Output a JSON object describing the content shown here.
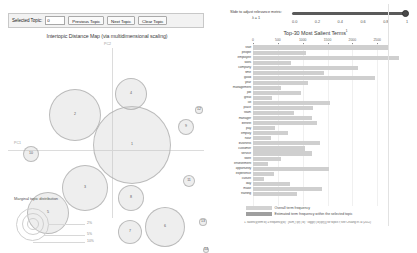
{
  "toolbar": {
    "selected_topic_label": "Selected Topic:",
    "topic_value": "0",
    "previous_button": "Previous Topic",
    "next_button": "Next Topic",
    "clear_button": "Clear Topic"
  },
  "left_panel": {
    "title": "Intertopic Distance Map (via multidimensional scaling)",
    "axis_x_label": "PC1",
    "axis_y_label": "PC2",
    "legend": {
      "title": "Marginal topic distribution",
      "sizes": [
        "2%",
        "5%",
        "10%"
      ]
    },
    "topics": [
      {
        "id": "1",
        "x": 132,
        "y": 105,
        "r": 39
      },
      {
        "id": "2",
        "x": 75,
        "y": 75,
        "r": 26
      },
      {
        "id": "3",
        "x": 85,
        "y": 148,
        "r": 23
      },
      {
        "id": "4",
        "x": 131,
        "y": 54,
        "r": 16
      },
      {
        "id": "5",
        "x": 48,
        "y": 173,
        "r": 21
      },
      {
        "id": "6",
        "x": 165,
        "y": 187,
        "r": 20
      },
      {
        "id": "7",
        "x": 130,
        "y": 192,
        "r": 12
      },
      {
        "id": "8",
        "x": 131,
        "y": 158,
        "r": 13
      },
      {
        "id": "9",
        "x": 186,
        "y": 87,
        "r": 8
      },
      {
        "id": "10",
        "x": 31,
        "y": 114,
        "r": 8
      },
      {
        "id": "11",
        "x": 189,
        "y": 141,
        "r": 6
      },
      {
        "id": "12",
        "x": 199,
        "y": 70,
        "r": 4
      },
      {
        "id": "13",
        "x": 203,
        "y": 182,
        "r": 4
      },
      {
        "id": "14",
        "x": 206,
        "y": 210,
        "r": 3
      }
    ]
  },
  "right_panel": {
    "slider_label_line1": "Slide to adjust relevance metric:",
    "slider_label_line2": "λ = 1",
    "slider_value": 1,
    "slider_ticks": [
      "0.0",
      "0.2",
      "0.4",
      "0.6",
      "0.8",
      "1"
    ],
    "chart_title": "Top-30 Most Salient Terms",
    "chart_title_sup": "(1)",
    "legend_overall": "Overall term frequency",
    "legend_estimated": "Estimated term frequency within the selected topic",
    "footnote": "1. saliency(term w) = frequency(w) * [sum_t p(t | w) * log(p(t | w)/p(t))] for topics t; see Chuang et. al (2012)"
  },
  "chart_data": {
    "type": "bar",
    "orientation": "horizontal",
    "title": "Top-30 Most Salient Terms",
    "xlabel": "",
    "ylabel": "",
    "xlim": [
      0,
      3000
    ],
    "xticks": [
      0,
      500,
      1000,
      1500,
      2000,
      2500
    ],
    "grid": true,
    "legend_position": "bottom",
    "categories": [
      "staff",
      "people",
      "employee",
      "work",
      "company",
      "time",
      "good",
      "year",
      "management",
      "job",
      "great",
      "lot",
      "place",
      "team",
      "manager",
      "benefit",
      "pay",
      "employ",
      "hour",
      "business",
      "customer",
      "service",
      "store",
      "environment",
      "opportunity",
      "experience",
      "culture",
      "day",
      "make",
      "training"
    ],
    "series": [
      {
        "name": "Overall term frequency",
        "values": [
          2730,
          1060,
          2930,
          770,
          2110,
          1430,
          2460,
          1110,
          560,
          970,
          380,
          1560,
          1200,
          830,
          1180,
          1290,
          450,
          700,
          360,
          1340,
          1040,
          1190,
          560,
          300,
          1530,
          430,
          230,
          750,
          1390,
          890
        ]
      }
    ]
  }
}
